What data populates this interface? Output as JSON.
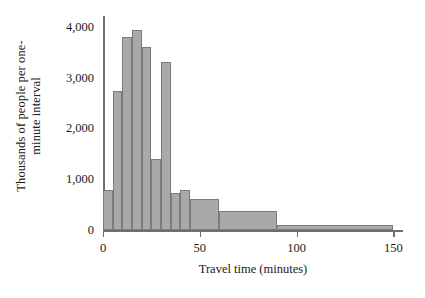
{
  "chart_data": {
    "type": "bar",
    "title": "",
    "subtitle": "",
    "xlabel": "Travel time (minutes)",
    "ylabel": "Thousands of people per one-minute interval",
    "ylabel_line1": "Thousands of people per one-",
    "ylabel_line2": "minute interval",
    "xlim": [
      0,
      155
    ],
    "ylim": [
      0,
      4200
    ],
    "grid": false,
    "legend": null,
    "xticks": [
      0,
      50,
      100,
      150
    ],
    "xtick_labels": [
      "0",
      "50",
      "100",
      "150"
    ],
    "yticks": [
      0,
      1000,
      2000,
      3000,
      4000
    ],
    "ytick_labels": [
      "0",
      "1,000",
      "2,000",
      "3,000",
      "4,000"
    ],
    "bar_color": "#a9a9a9",
    "bar_edge_color": "#7b7b7b",
    "axis_color": "#6e6e6e",
    "bins": [
      {
        "label": "0-5",
        "x0": 0,
        "x1": 5,
        "value": 800
      },
      {
        "label": "5-10",
        "x0": 5,
        "x1": 10,
        "value": 2740
      },
      {
        "label": "10-15",
        "x0": 10,
        "x1": 15,
        "value": 3790
      },
      {
        "label": "15-20",
        "x0": 15,
        "x1": 20,
        "value": 3930
      },
      {
        "label": "20-25",
        "x0": 20,
        "x1": 25,
        "value": 3600
      },
      {
        "label": "25-30",
        "x0": 25,
        "x1": 30,
        "value": 1400
      },
      {
        "label": "30-35",
        "x0": 30,
        "x1": 35,
        "value": 3300
      },
      {
        "label": "35-40",
        "x0": 35,
        "x1": 40,
        "value": 740
      },
      {
        "label": "40-45",
        "x0": 40,
        "x1": 45,
        "value": 800
      },
      {
        "label": "45-60",
        "x0": 45,
        "x1": 60,
        "value": 620
      },
      {
        "label": "60-90",
        "x0": 60,
        "x1": 90,
        "value": 380
      },
      {
        "label": "90-150",
        "x0": 90,
        "x1": 150,
        "value": 110
      }
    ]
  }
}
